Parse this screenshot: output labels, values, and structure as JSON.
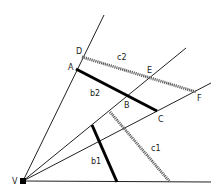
{
  "diagram": {
    "vertex": {
      "label": "V",
      "x": 23,
      "y": 181
    },
    "rays": [
      {
        "name": "ray-va",
        "x2": 104,
        "y2": 15
      },
      {
        "name": "ray-ve",
        "x2": 186,
        "y2": 48
      },
      {
        "name": "ray-vf",
        "x2": 211,
        "y2": 83
      },
      {
        "name": "ray-base",
        "x2": 211,
        "y2": 182
      }
    ],
    "points": [
      {
        "label": "D",
        "x": 82,
        "y": 57,
        "lx": 76,
        "ly": 54
      },
      {
        "label": "A",
        "x": 76,
        "y": 69,
        "lx": 68,
        "ly": 70
      },
      {
        "label": "E",
        "x": 151,
        "y": 78,
        "lx": 147,
        "ly": 73
      },
      {
        "label": "B",
        "x": 127,
        "y": 95,
        "lx": 124,
        "ly": 108
      },
      {
        "label": "C",
        "x": 157,
        "y": 111,
        "lx": 158,
        "ly": 122
      },
      {
        "label": "F",
        "x": 196,
        "y": 92,
        "lx": 197,
        "ly": 101
      },
      {
        "label": "V",
        "x": 23,
        "y": 181,
        "lx": 12,
        "ly": 184
      }
    ],
    "segments": [
      {
        "label": "b2",
        "x1": 76,
        "y1": 69,
        "x2": 157,
        "y2": 111,
        "style": "thick",
        "lx": 90,
        "ly": 96
      },
      {
        "label": "c2",
        "x1": 82,
        "y1": 57,
        "x2": 196,
        "y2": 92,
        "style": "hatched",
        "lx": 117,
        "ly": 60
      },
      {
        "label": "b1",
        "x1": 92,
        "y1": 125,
        "x2": 117,
        "y2": 182,
        "style": "thick",
        "lx": 91,
        "ly": 164
      },
      {
        "label": "c1",
        "x1": 110,
        "y1": 112,
        "x2": 170,
        "y2": 182,
        "style": "hatched",
        "lx": 151,
        "ly": 151
      }
    ]
  }
}
